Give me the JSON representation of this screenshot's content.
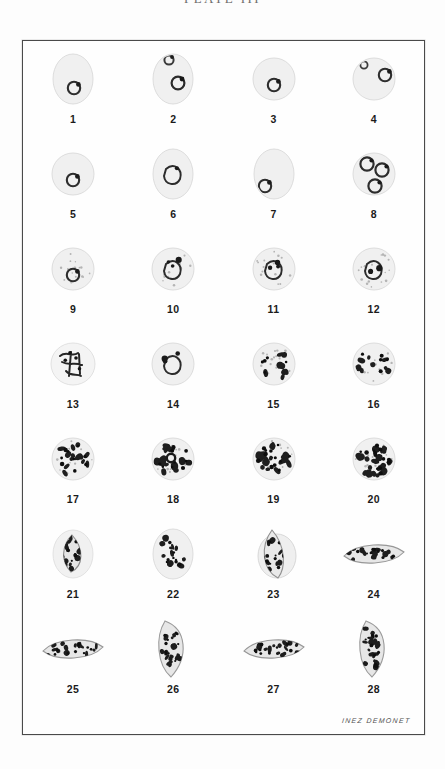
{
  "plate": {
    "title": "PLATE III",
    "title_visible_note": "cropped at top edge",
    "signature": "INEZ DEMONET",
    "frame_color": "#4a4a4a",
    "background_color": "#fefefe",
    "ink_color": "#1b1b1b"
  },
  "grid": {
    "columns": 4,
    "rows": 7,
    "total_figures": 28
  },
  "figures": [
    {
      "number": "1",
      "shape": "oval-cell",
      "form": "ring-trophozoite",
      "stipple": false,
      "chromatin": 1,
      "pigment": 1
    },
    {
      "number": "2",
      "shape": "oval-cell",
      "form": "double-ring",
      "stipple": false,
      "chromatin": 2,
      "pigment": 2
    },
    {
      "number": "3",
      "shape": "round-cell",
      "form": "ring-trophozoite",
      "stipple": false,
      "chromatin": 1,
      "pigment": 1
    },
    {
      "number": "4",
      "shape": "round-cell",
      "form": "applique-ring",
      "stipple": false,
      "chromatin": 2,
      "pigment": 2
    },
    {
      "number": "5",
      "shape": "round-cell",
      "form": "ring-trophozoite",
      "stipple": false,
      "chromatin": 1,
      "pigment": 1
    },
    {
      "number": "6",
      "shape": "oval-cell",
      "form": "ameboid-trophozoite",
      "stipple": false,
      "chromatin": 1,
      "pigment": 2
    },
    {
      "number": "7",
      "shape": "oval-cell",
      "form": "marginal-ring",
      "stipple": false,
      "chromatin": 1,
      "pigment": 2
    },
    {
      "number": "8",
      "shape": "round-cell",
      "form": "multiple-infection",
      "stipple": false,
      "chromatin": 3,
      "pigment": 4
    },
    {
      "number": "9",
      "shape": "round-cell",
      "form": "ring-trophozoite",
      "stipple": true,
      "chromatin": 2,
      "pigment": 2
    },
    {
      "number": "10",
      "shape": "round-cell",
      "form": "ameboid-trophozoite",
      "stipple": true,
      "chromatin": 3,
      "pigment": 3
    },
    {
      "number": "11",
      "shape": "round-cell",
      "form": "ameboid-trophozoite",
      "stipple": true,
      "chromatin": 3,
      "pigment": 4
    },
    {
      "number": "12",
      "shape": "round-cell",
      "form": "growing-trophozoite",
      "stipple": true,
      "chromatin": 2,
      "pigment": 3
    },
    {
      "number": "13",
      "shape": "irregular-cell",
      "form": "branched-ameboid",
      "stipple": false,
      "chromatin": 4,
      "pigment": 6
    },
    {
      "number": "14",
      "shape": "round-cell",
      "form": "compact-trophozoite",
      "stipple": false,
      "chromatin": 3,
      "pigment": 4
    },
    {
      "number": "15",
      "shape": "round-cell",
      "form": "late-trophozoite",
      "stipple": true,
      "chromatin": 5,
      "pigment": 8
    },
    {
      "number": "16",
      "shape": "round-cell",
      "form": "early-schizont",
      "stipple": true,
      "chromatin": 5,
      "pigment": 8
    },
    {
      "number": "17",
      "shape": "round-cell",
      "form": "schizont",
      "stipple": true,
      "chromatin": 9,
      "pigment": 14
    },
    {
      "number": "18",
      "shape": "round-cell",
      "form": "schizont",
      "stipple": true,
      "chromatin": 9,
      "pigment": 14
    },
    {
      "number": "19",
      "shape": "round-cell",
      "form": "mature-schizont",
      "stipple": true,
      "chromatin": 12,
      "pigment": 18
    },
    {
      "number": "20",
      "shape": "round-cell",
      "form": "segmenter-merozoites",
      "stipple": true,
      "chromatin": 14,
      "pigment": 20
    },
    {
      "number": "21",
      "shape": "teardrop",
      "form": "immature-gametocyte",
      "stipple": false,
      "chromatin": 8,
      "pigment": 12
    },
    {
      "number": "22",
      "shape": "oval-cell",
      "form": "immature-gametocyte",
      "stipple": false,
      "chromatin": 8,
      "pigment": 12
    },
    {
      "number": "23",
      "shape": "wedge",
      "form": "developing-gametocyte",
      "stipple": false,
      "chromatin": 8,
      "pigment": 12
    },
    {
      "number": "24",
      "shape": "elongate",
      "form": "developing-gametocyte",
      "stipple": false,
      "chromatin": 9,
      "pigment": 14
    },
    {
      "number": "25",
      "shape": "elongate",
      "form": "mature-gametocyte",
      "stipple": false,
      "chromatin": 10,
      "pigment": 16
    },
    {
      "number": "26",
      "shape": "crescent",
      "form": "crescent-gametocyte",
      "stipple": false,
      "chromatin": 10,
      "pigment": 16
    },
    {
      "number": "27",
      "shape": "elongate",
      "form": "mature-gametocyte",
      "stipple": false,
      "chromatin": 10,
      "pigment": 16
    },
    {
      "number": "28",
      "shape": "crescent",
      "form": "crescent-gametocyte",
      "stipple": false,
      "chromatin": 10,
      "pigment": 16
    }
  ]
}
